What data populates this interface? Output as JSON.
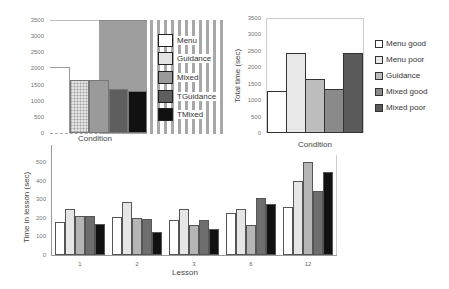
{
  "chart_data": [
    {
      "id": "chart1",
      "type": "bar",
      "title": "",
      "xlabel": "Condition",
      "ylabel": "",
      "ylim": [
        0,
        3500
      ],
      "yticks": [
        0,
        500,
        1000,
        1500,
        2000,
        2500,
        3000,
        3500
      ],
      "categories": [
        "Menu",
        "Guidance",
        "Mixed",
        "TGuidance",
        "TMixed"
      ],
      "values": [
        2050,
        1630,
        1650,
        1370,
        1310
      ],
      "colors": [
        "#ffffff",
        "#e4e4e4",
        "#9a9a9a",
        "#5e5e5e",
        "#111111"
      ],
      "legend": [
        "Menu",
        "Guidance",
        "Mixed",
        "TGuidance",
        "TMixed"
      ],
      "legend_position": "right",
      "grid": false
    },
    {
      "id": "chart2",
      "type": "bar",
      "title": "",
      "xlabel": "Condition",
      "ylabel": "Total time (sec)",
      "ylim": [
        0,
        3500
      ],
      "yticks": [
        0,
        500,
        1000,
        1500,
        2000,
        2500,
        3000,
        3500
      ],
      "categories": [
        "Menu good",
        "Menu poor",
        "Guidance",
        "Mixed good",
        "Mixed poor"
      ],
      "values": [
        1270,
        2430,
        1640,
        1340,
        2430
      ],
      "colors": [
        "#ffffff",
        "#e8e8e8",
        "#bdbdbd",
        "#8a8a8a",
        "#5a5a5a"
      ],
      "legend": [
        "Menu good",
        "Menu poor",
        "Guidance",
        "Mixed good",
        "Mixed poor"
      ],
      "legend_position": "right",
      "grid": false
    },
    {
      "id": "chart3",
      "type": "bar",
      "title": "",
      "xlabel": "Lesson",
      "ylabel": "Time in lesson (sec)",
      "ylim": [
        0,
        500
      ],
      "yticks": [
        0,
        100,
        200,
        300,
        400,
        500
      ],
      "categories": [
        "1",
        "2",
        "3",
        "6",
        "12"
      ],
      "series": [
        {
          "name": "s1",
          "color": "#ffffff",
          "values": [
            178,
            205,
            188,
            226,
            258
          ]
        },
        {
          "name": "s2",
          "color": "#e6e6e6",
          "values": [
            248,
            285,
            247,
            247,
            398
          ]
        },
        {
          "name": "s3",
          "color": "#b5b5b5",
          "values": [
            208,
            200,
            162,
            162,
            500
          ]
        },
        {
          "name": "s4",
          "color": "#6e6e6e",
          "values": [
            208,
            195,
            188,
            306,
            344
          ]
        },
        {
          "name": "s5",
          "color": "#111111",
          "values": [
            168,
            125,
            140,
            274,
            446
          ]
        }
      ],
      "grid": false
    }
  ]
}
